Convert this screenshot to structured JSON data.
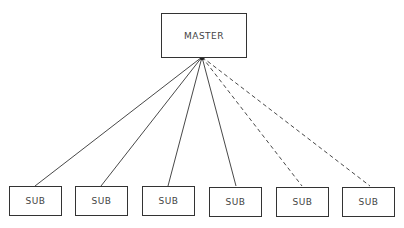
{
  "diagram": {
    "type": "tree",
    "master": {
      "label": "MASTER"
    },
    "subs": [
      {
        "label": "SUB",
        "link": "solid"
      },
      {
        "label": "SUB",
        "link": "solid"
      },
      {
        "label": "SUB",
        "link": "solid"
      },
      {
        "label": "SUB",
        "link": "solid"
      },
      {
        "label": "SUB",
        "link": "dashed"
      },
      {
        "label": "SUB",
        "link": "dashed"
      }
    ]
  }
}
